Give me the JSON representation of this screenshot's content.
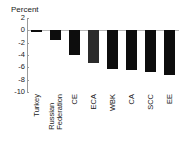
{
  "chart_data": {
    "type": "bar",
    "title": "Percent",
    "xlabel": "",
    "ylabel": "",
    "ylim": [
      -10,
      2
    ],
    "ytick_values": [
      2,
      0,
      -2,
      -4,
      -6,
      -8,
      -10
    ],
    "ytick_labels": [
      "2",
      "0",
      "-2",
      "-4",
      "-6",
      "-8",
      "-10"
    ],
    "grid": false,
    "legend": "none",
    "orientation": "vertical",
    "categories": [
      "Turkey",
      "Russian Federation",
      "CE",
      "ECA",
      "WBK",
      "CA",
      "SCC",
      "EE"
    ],
    "category_lines": [
      [
        "Turkey"
      ],
      [
        "Russian",
        "Federation"
      ],
      [
        "CE"
      ],
      [
        "ECA"
      ],
      [
        "WBK"
      ],
      [
        "CA"
      ],
      [
        "SCC"
      ],
      [
        "EE"
      ]
    ],
    "values": [
      -0.2,
      -1.5,
      -4.0,
      -5.3,
      -6.3,
      -6.4,
      -6.8,
      -7.3
    ],
    "bar_colors": [
      "#0d0d0d",
      "#0d0d0d",
      "#0d0d0d",
      "#2b2b2b",
      "#0d0d0d",
      "#0d0d0d",
      "#0d0d0d",
      "#0d0d0d"
    ],
    "axis_color": "#9a9a9a",
    "zero_line_color": "#b8b8b8",
    "background_color": "#ffffff",
    "text_color": "#1a1a1a"
  }
}
